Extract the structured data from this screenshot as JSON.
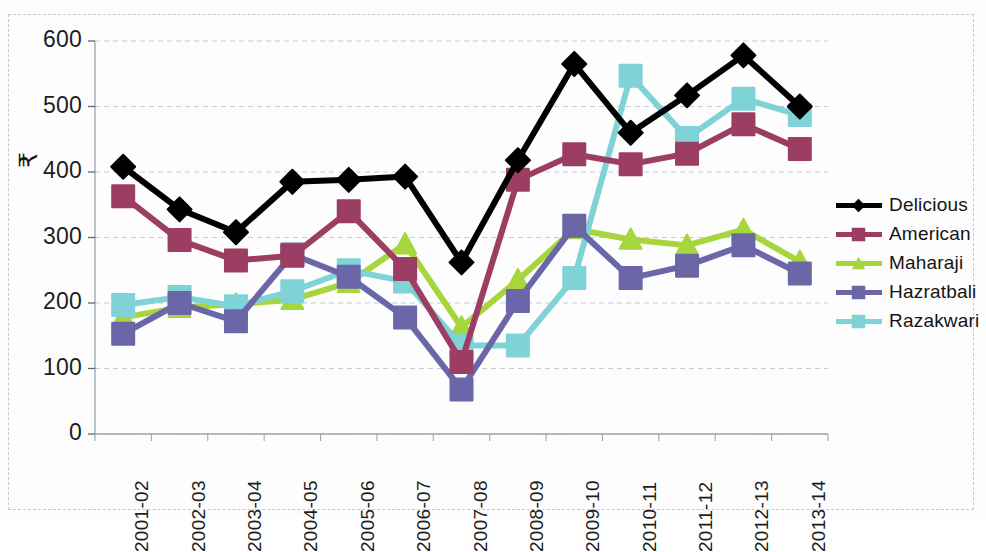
{
  "chart_data": {
    "type": "line",
    "title": "",
    "xlabel": "",
    "ylabel": "₹",
    "ylim": [
      0,
      600
    ],
    "ytick_step": 100,
    "yticks": [
      0,
      100,
      200,
      300,
      400,
      500,
      600
    ],
    "grid": true,
    "legend_position": "right",
    "categories": [
      "2001-02",
      "2002-03",
      "2003-04",
      "2004-05",
      "2005-06",
      "2006-07",
      "2007-08",
      "2008-09",
      "2009-10",
      "2010-11",
      "2011-12",
      "2012-13",
      "2013-14"
    ],
    "series": [
      {
        "name": "Delicious",
        "color": "#000000",
        "marker": "diamond",
        "values": [
          408,
          343,
          308,
          385,
          388,
          393,
          262,
          418,
          565,
          460,
          517,
          578,
          500
        ]
      },
      {
        "name": "American",
        "color": "#9c3d63",
        "marker": "square",
        "values": [
          363,
          296,
          265,
          272,
          340,
          252,
          110,
          388,
          427,
          412,
          428,
          473,
          435
        ]
      },
      {
        "name": "Maharaji",
        "color": "#a7d63c",
        "marker": "triangle",
        "values": [
          178,
          193,
          198,
          205,
          231,
          290,
          163,
          235,
          313,
          297,
          288,
          312,
          263
        ]
      },
      {
        "name": "Hazratbali",
        "color": "#6b66a8",
        "marker": "square",
        "values": [
          153,
          200,
          172,
          274,
          240,
          178,
          68,
          203,
          318,
          238,
          257,
          288,
          245
        ]
      },
      {
        "name": "Razakwari",
        "color": "#7fd2d6",
        "marker": "square",
        "values": [
          197,
          209,
          195,
          218,
          250,
          233,
          135,
          135,
          238,
          547,
          452,
          512,
          487
        ]
      }
    ]
  },
  "legend": {
    "items": [
      {
        "label": "Delicious"
      },
      {
        "label": "American"
      },
      {
        "label": "Maharaji"
      },
      {
        "label": "Hazratbali"
      },
      {
        "label": "Razakwari"
      }
    ]
  },
  "axes": {
    "y_title": "₹"
  }
}
